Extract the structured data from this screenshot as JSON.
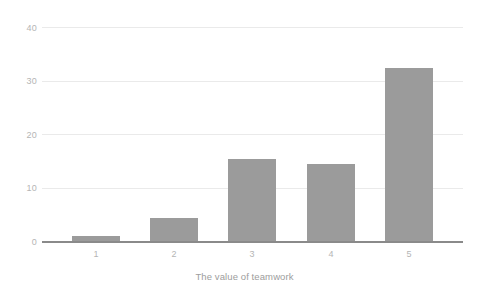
{
  "chart_data": {
    "type": "bar",
    "title": "",
    "subtitle": "",
    "xlabel": "The value of teamwork",
    "ylabel": "",
    "categories": [
      "1",
      "2",
      "3",
      "4",
      "5"
    ],
    "values": [
      1,
      4.3,
      15.3,
      14.4,
      32.4
    ],
    "ylim": [
      0,
      40
    ],
    "yticks": [
      0,
      10,
      20,
      30,
      40
    ],
    "ytick_labels": [
      "0",
      "10",
      "20",
      "30",
      "40"
    ],
    "grid": true,
    "legend": false,
    "legend_position": "none",
    "colors": {
      "bar": "#9b9b9b",
      "grid": "#eaeaea",
      "axis": "#8a8a8a",
      "tick_text": "#b5b5b5",
      "title_text": "#9d9d9d",
      "background": "#ffffff"
    }
  },
  "axis": {
    "x_title": "The value of teamwork",
    "y_ticks": [
      {
        "label": "40",
        "value": 40
      },
      {
        "label": "30",
        "value": 30
      },
      {
        "label": "20",
        "value": 20
      },
      {
        "label": "10",
        "value": 10
      },
      {
        "label": "0",
        "value": 0
      }
    ],
    "x_ticks": [
      {
        "label": "1"
      },
      {
        "label": "2"
      },
      {
        "label": "3"
      },
      {
        "label": "4"
      },
      {
        "label": "5"
      }
    ]
  }
}
